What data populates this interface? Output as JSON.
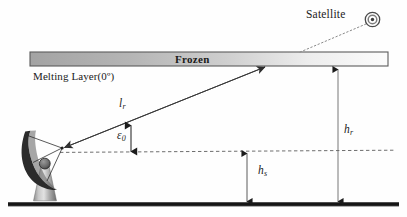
{
  "figure": {
    "type": "diagram",
    "background_color": "#fefefe"
  },
  "labels": {
    "satellite": "Satellite",
    "frozen": "Frozen",
    "melting_layer": "Melting Layer(0º)",
    "rain_path_length": "l",
    "rain_path_length_sub": "r",
    "elevation_angle": "ε",
    "elevation_angle_sub": "0",
    "rain_height": "h",
    "rain_height_sub": "r",
    "station_height": "h",
    "station_height_sub": "s"
  },
  "elements": {
    "satellite_icon": "satellite-bullseye-icon",
    "antenna_icon": "parabolic-dish-antenna",
    "ground_line": "ground-surface",
    "horizontal_reference": "dashed-horizon-line",
    "frozen_bar": "frozen-layer-band",
    "slant_path": "slant-path-ray",
    "satellite_link": "dotted-satellite-link"
  },
  "colors": {
    "ink": "#1b1b1b",
    "bar_stroke": "#555555",
    "bar_fill_left": "#a8a8a8",
    "bar_fill_right": "#fbfbfb",
    "ground": "#111111",
    "dashed": "#666666",
    "ray": "#3a3a3a",
    "dish": "#2b2b2b",
    "pedestal_light": "#d6d6d6",
    "pedestal_dark": "#6e6e6e"
  },
  "geometry": {
    "bar_x1": 30,
    "bar_x2": 388,
    "bar_y_top": 52,
    "bar_y_bottom": 66,
    "ground_y": 205,
    "dashed_y": 152,
    "feed_x": 62,
    "feed_y": 148,
    "ray_hit_x": 265,
    "ray_hit_y": 66,
    "satellite_x": 372,
    "satellite_y": 20,
    "hr_arrow_x": 338,
    "hs_arrow_x": 247
  }
}
